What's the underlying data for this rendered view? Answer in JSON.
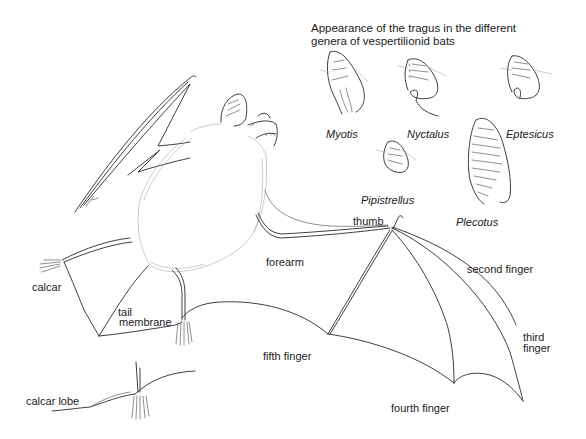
{
  "figure": {
    "title_lines": [
      "Appearance of the tragus in the different",
      "genera of vespertilionid bats"
    ],
    "tragus_genera": [
      {
        "name": "Myotis"
      },
      {
        "name": "Nyctalus"
      },
      {
        "name": "Eptesicus"
      },
      {
        "name": "Pipistrellus"
      },
      {
        "name": "Plecotus"
      }
    ],
    "anatomy_labels": {
      "thumb": "thumb",
      "forearm": "forearm",
      "second_finger": "second finger",
      "third_finger_line1": "third",
      "third_finger_line2": "finger",
      "fourth_finger": "fourth finger",
      "fifth_finger": "fifth finger",
      "calcar": "calcar",
      "tail_membrane_line1": "tail",
      "tail_membrane_line2": "membrane",
      "calcar_lobe": "calcar lobe"
    },
    "colors": {
      "background": "#ffffff",
      "ink": "#1a1a1a",
      "fur": "#9a9a9a"
    }
  }
}
